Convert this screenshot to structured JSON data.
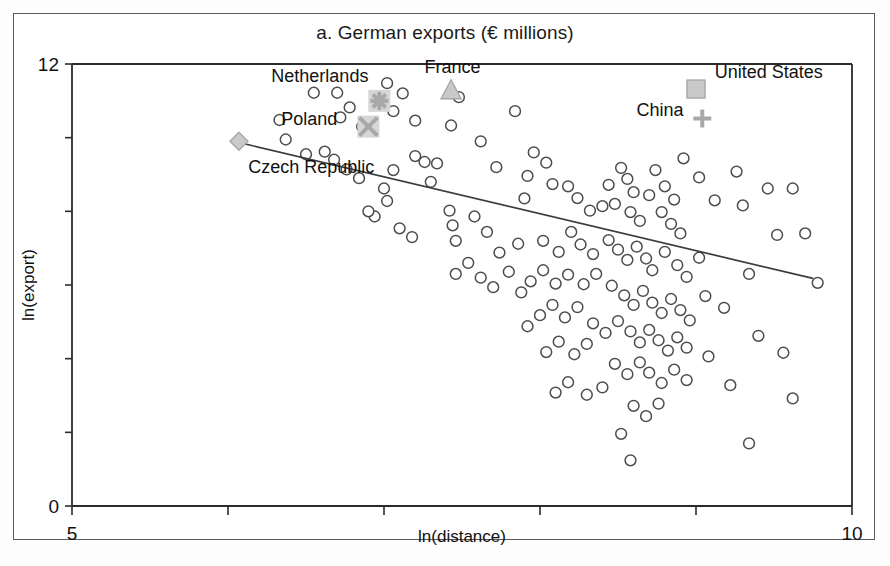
{
  "chart_data": {
    "type": "scatter",
    "title": "a. German exports (€ millions)",
    "xlabel": "ln(distance)",
    "ylabel": "ln(export)",
    "xlim": [
      5,
      10
    ],
    "ylim": [
      0,
      12
    ],
    "xticks": [
      5,
      6,
      7,
      8,
      9,
      10
    ],
    "xtick_labels": [
      "5",
      "",
      "",
      "",
      "",
      "10"
    ],
    "yticks": [
      0,
      2,
      4,
      6,
      8,
      10,
      12
    ],
    "ytick_labels": [
      "0",
      "",
      "",
      "",
      "",
      "",
      "12"
    ],
    "grid": false,
    "legend": "none",
    "series": [
      {
        "name": "Trading partners",
        "marker": "open-circle",
        "points": [
          [
            6.33,
            10.48
          ],
          [
            6.55,
            11.22
          ],
          [
            6.7,
            11.22
          ],
          [
            6.78,
            10.82
          ],
          [
            6.72,
            10.55
          ],
          [
            6.86,
            10.3
          ],
          [
            7.02,
            11.48
          ],
          [
            7.12,
            11.2
          ],
          [
            7.06,
            10.72
          ],
          [
            7.2,
            10.46
          ],
          [
            7.48,
            11.1
          ],
          [
            7.43,
            10.33
          ],
          [
            6.37,
            9.95
          ],
          [
            6.5,
            9.55
          ],
          [
            6.62,
            9.62
          ],
          [
            6.68,
            9.4
          ],
          [
            6.76,
            9.14
          ],
          [
            6.84,
            8.9
          ],
          [
            7.06,
            9.12
          ],
          [
            7.0,
            8.62
          ],
          [
            7.02,
            8.28
          ],
          [
            7.2,
            9.5
          ],
          [
            7.26,
            9.34
          ],
          [
            7.34,
            9.3
          ],
          [
            7.3,
            8.8
          ],
          [
            7.42,
            8.02
          ],
          [
            7.44,
            7.62
          ],
          [
            7.46,
            7.2
          ],
          [
            7.62,
            9.9
          ],
          [
            7.72,
            9.2
          ],
          [
            7.84,
            10.72
          ],
          [
            7.96,
            9.6
          ],
          [
            7.92,
            8.96
          ],
          [
            7.9,
            8.35
          ],
          [
            8.04,
            9.32
          ],
          [
            8.08,
            8.74
          ],
          [
            8.18,
            8.68
          ],
          [
            8.24,
            8.36
          ],
          [
            8.32,
            8.02
          ],
          [
            8.4,
            8.14
          ],
          [
            8.44,
            8.72
          ],
          [
            8.52,
            9.18
          ],
          [
            8.56,
            8.88
          ],
          [
            8.6,
            8.52
          ],
          [
            8.48,
            8.2
          ],
          [
            8.58,
            7.98
          ],
          [
            8.64,
            7.74
          ],
          [
            8.7,
            8.44
          ],
          [
            8.74,
            9.12
          ],
          [
            8.8,
            8.68
          ],
          [
            8.86,
            8.32
          ],
          [
            8.92,
            9.44
          ],
          [
            8.78,
            7.98
          ],
          [
            8.84,
            7.66
          ],
          [
            8.9,
            7.4
          ],
          [
            9.02,
            8.92
          ],
          [
            9.12,
            8.3
          ],
          [
            9.26,
            9.08
          ],
          [
            9.3,
            8.16
          ],
          [
            9.46,
            8.62
          ],
          [
            9.52,
            7.36
          ],
          [
            8.2,
            7.44
          ],
          [
            8.26,
            7.1
          ],
          [
            8.34,
            6.84
          ],
          [
            8.12,
            6.9
          ],
          [
            8.02,
            7.2
          ],
          [
            7.86,
            7.12
          ],
          [
            7.74,
            6.88
          ],
          [
            7.66,
            7.44
          ],
          [
            7.58,
            7.86
          ],
          [
            8.44,
            7.22
          ],
          [
            8.5,
            6.96
          ],
          [
            8.56,
            6.68
          ],
          [
            8.62,
            7.04
          ],
          [
            8.68,
            6.72
          ],
          [
            8.72,
            6.4
          ],
          [
            8.8,
            6.9
          ],
          [
            8.88,
            6.54
          ],
          [
            8.94,
            6.22
          ],
          [
            9.02,
            6.74
          ],
          [
            8.36,
            6.3
          ],
          [
            8.28,
            6.02
          ],
          [
            8.18,
            6.28
          ],
          [
            8.1,
            6.04
          ],
          [
            8.02,
            6.4
          ],
          [
            7.94,
            6.1
          ],
          [
            7.88,
            5.8
          ],
          [
            8.46,
            5.98
          ],
          [
            8.54,
            5.72
          ],
          [
            8.6,
            5.46
          ],
          [
            8.66,
            5.84
          ],
          [
            8.72,
            5.52
          ],
          [
            8.78,
            5.24
          ],
          [
            8.84,
            5.62
          ],
          [
            8.9,
            5.32
          ],
          [
            8.96,
            5.04
          ],
          [
            9.06,
            5.7
          ],
          [
            9.18,
            5.38
          ],
          [
            9.34,
            6.3
          ],
          [
            9.4,
            4.62
          ],
          [
            8.24,
            5.4
          ],
          [
            8.16,
            5.12
          ],
          [
            8.08,
            5.46
          ],
          [
            8.0,
            5.18
          ],
          [
            7.92,
            4.88
          ],
          [
            8.34,
            4.96
          ],
          [
            8.42,
            4.7
          ],
          [
            8.5,
            5.02
          ],
          [
            8.58,
            4.74
          ],
          [
            8.64,
            4.44
          ],
          [
            8.7,
            4.78
          ],
          [
            8.76,
            4.5
          ],
          [
            8.82,
            4.22
          ],
          [
            8.88,
            4.58
          ],
          [
            8.94,
            4.3
          ],
          [
            9.08,
            4.06
          ],
          [
            9.56,
            4.16
          ],
          [
            8.3,
            4.4
          ],
          [
            8.22,
            4.12
          ],
          [
            8.12,
            4.46
          ],
          [
            8.04,
            4.18
          ],
          [
            8.48,
            3.86
          ],
          [
            8.56,
            3.58
          ],
          [
            8.64,
            3.9
          ],
          [
            8.7,
            3.62
          ],
          [
            8.78,
            3.34
          ],
          [
            8.86,
            3.7
          ],
          [
            8.94,
            3.42
          ],
          [
            9.22,
            3.28
          ],
          [
            9.62,
            2.92
          ],
          [
            8.4,
            3.22
          ],
          [
            8.3,
            3.02
          ],
          [
            8.18,
            3.36
          ],
          [
            8.1,
            3.08
          ],
          [
            8.6,
            2.72
          ],
          [
            8.68,
            2.44
          ],
          [
            8.76,
            2.78
          ],
          [
            8.52,
            1.96
          ],
          [
            8.58,
            1.24
          ],
          [
            9.34,
            1.7
          ],
          [
            7.7,
            5.94
          ],
          [
            7.8,
            6.36
          ],
          [
            7.62,
            6.2
          ],
          [
            7.54,
            6.6
          ],
          [
            7.46,
            6.3
          ],
          [
            6.94,
            7.86
          ],
          [
            7.1,
            7.54
          ],
          [
            7.18,
            7.3
          ],
          [
            6.9,
            8.0
          ],
          [
            9.7,
            7.4
          ],
          [
            9.62,
            8.62
          ],
          [
            9.78,
            6.06
          ]
        ]
      }
    ],
    "highlighted": [
      {
        "label": "Czech Republic",
        "marker": "diamond",
        "x": 6.07,
        "y": 9.9,
        "label_x": 6.13,
        "label_y": 9.05,
        "label_anchor": "start"
      },
      {
        "label": "Poland",
        "marker": "x",
        "x": 6.9,
        "y": 10.3,
        "label_x": 6.7,
        "label_y": 10.35,
        "label_anchor": "end"
      },
      {
        "label": "Netherlands",
        "marker": "star",
        "x": 6.97,
        "y": 11.0,
        "label_x": 6.9,
        "label_y": 11.5,
        "label_anchor": "end"
      },
      {
        "label": "France",
        "marker": "triangle",
        "x": 7.43,
        "y": 11.3,
        "label_x": 7.44,
        "label_y": 11.75,
        "label_anchor": "middle"
      },
      {
        "label": "United States",
        "marker": "square",
        "x": 9.0,
        "y": 11.32,
        "label_x": 9.12,
        "label_y": 11.63,
        "label_anchor": "start"
      },
      {
        "label": "China",
        "marker": "plus",
        "x": 9.04,
        "y": 10.52,
        "label_x": 8.92,
        "label_y": 10.6,
        "label_anchor": "end"
      }
    ],
    "fit_line": {
      "x1": 6.06,
      "y1": 9.88,
      "x2": 9.75,
      "y2": 6.18
    },
    "colors": {
      "marker_stroke": "#4d4d4d",
      "highlight_fill": "#c9c9c9",
      "highlight_stroke": "#a8a8a8",
      "fit_line": "#3d3d3d",
      "axis": "#2b2b2b",
      "text": "#111111",
      "frame": "#5a5a5a"
    }
  }
}
